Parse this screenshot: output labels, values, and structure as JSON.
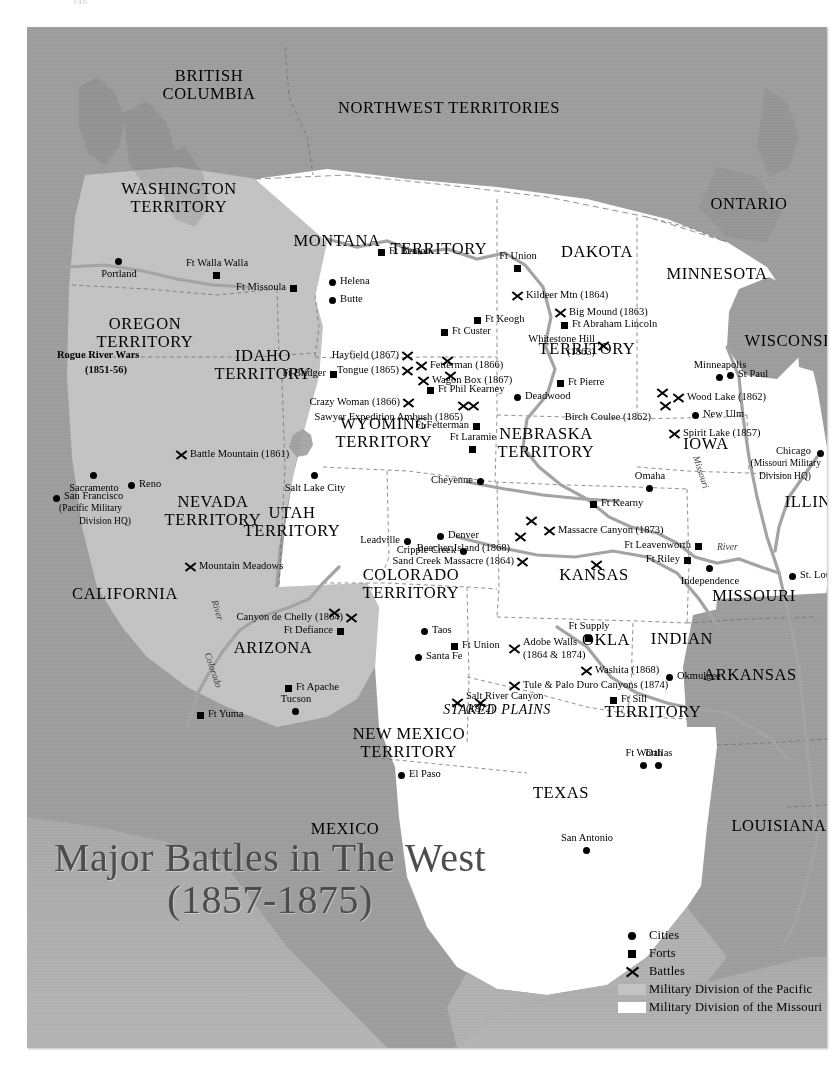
{
  "page": {
    "number": "146"
  },
  "title": {
    "line1": "Major Battles in The West",
    "line2": "(1857-1875)"
  },
  "colors": {
    "military_division_pacific": "#c2c2c2",
    "military_division_missouri": "#ffffff",
    "outside_us": "#9d9d9d",
    "water": "#b0b0b0",
    "ink": "#000000",
    "title_ink": "#4b4b4b"
  },
  "legend": {
    "items": [
      {
        "symbol": "dot",
        "label": "Cities"
      },
      {
        "symbol": "square",
        "label": "Forts"
      },
      {
        "symbol": "x",
        "label": "Battles"
      },
      {
        "symbol": "swatch-gray",
        "label": "Military Division of the Pacific"
      },
      {
        "symbol": "swatch-white",
        "label": "Military Division of the Missouri"
      }
    ]
  },
  "regions": [
    {
      "name": "BRITISH COLUMBIA",
      "lines": [
        "BRITISH",
        "COLUMBIA"
      ],
      "x": 182,
      "y": 40
    },
    {
      "name": "NORTHWEST TERRITORIES",
      "lines": [
        "NORTHWEST TERRITORIES"
      ],
      "x": 422,
      "y": 72
    },
    {
      "name": "ONTARIO",
      "lines": [
        "ONTARIO"
      ],
      "x": 722,
      "y": 168
    },
    {
      "name": "WASHINGTON TERRITORY",
      "lines": [
        "WASHINGTON",
        "TERRITORY"
      ],
      "x": 152,
      "y": 153
    },
    {
      "name": "OREGON TERRITORY",
      "lines": [
        "OREGON",
        "TERRITORY"
      ],
      "x": 118,
      "y": 288
    },
    {
      "name": "IDAHO TERRITORY",
      "lines": [
        "IDAHO",
        "TERRITORY"
      ],
      "x": 236,
      "y": 320
    },
    {
      "name": "MONTANA TERRITORY",
      "lines": [
        "MONTANA"
      ],
      "x": 310,
      "y": 205
    },
    {
      "name": "MONTANA TERRITORY 2",
      "lines": [
        "TERRITORY"
      ],
      "x": 412,
      "y": 213
    },
    {
      "name": "DAKOTA",
      "lines": [
        "DAKOTA"
      ],
      "x": 570,
      "y": 216
    },
    {
      "name": "DAKOTA TERRITORY",
      "lines": [
        "TERRITORY"
      ],
      "x": 560,
      "y": 313
    },
    {
      "name": "MINNESOTA",
      "lines": [
        "MINNESOTA"
      ],
      "x": 690,
      "y": 238
    },
    {
      "name": "WISCONSIN",
      "lines": [
        "WISCONSIN"
      ],
      "x": 766,
      "y": 305
    },
    {
      "name": "WYOMING TERRITORY",
      "lines": [
        "WYOMING",
        "TERRITORY"
      ],
      "x": 357,
      "y": 388
    },
    {
      "name": "NEBRASKA TERRITORY",
      "lines": [
        "NEBRASKA",
        "TERRITORY"
      ],
      "x": 519,
      "y": 398
    },
    {
      "name": "IOWA",
      "lines": [
        "IOWA"
      ],
      "x": 679,
      "y": 408
    },
    {
      "name": "ILLINOIS",
      "lines": [
        "ILLINOIS"
      ],
      "x": 795,
      "y": 466
    },
    {
      "name": "NEVADA TERRITORY",
      "lines": [
        "NEVADA",
        "TERRITORY"
      ],
      "x": 186,
      "y": 466
    },
    {
      "name": "UTAH TERRITORY",
      "lines": [
        "UTAH",
        "TERRITORY"
      ],
      "x": 265,
      "y": 477
    },
    {
      "name": "CALIFORNIA",
      "lines": [
        "CALIFORNIA"
      ],
      "x": 98,
      "y": 558
    },
    {
      "name": "COLORADO TERRITORY",
      "lines": [
        "COLORADO",
        "TERRITORY"
      ],
      "x": 384,
      "y": 539
    },
    {
      "name": "KANSAS",
      "lines": [
        "KANSAS"
      ],
      "x": 567,
      "y": 539
    },
    {
      "name": "MISSOURI",
      "lines": [
        "MISSOURI"
      ],
      "x": 727,
      "y": 560
    },
    {
      "name": "ARIZONA",
      "lines": [
        "ARIZONA"
      ],
      "x": 246,
      "y": 612
    },
    {
      "name": "NEW MEXICO TERRITORY",
      "lines": [
        "NEW MEXICO",
        "TERRITORY"
      ],
      "x": 382,
      "y": 698
    },
    {
      "name": "OKLA",
      "lines": [
        "OKLA"
      ],
      "x": 579,
      "y": 604
    },
    {
      "name": "INDIAN",
      "lines": [
        "INDIAN"
      ],
      "x": 655,
      "y": 603
    },
    {
      "name": "INDIAN TERRITORY",
      "lines": [
        "TERRITORY"
      ],
      "x": 626,
      "y": 676
    },
    {
      "name": "ARKANSAS",
      "lines": [
        "ARKANSAS"
      ],
      "x": 723,
      "y": 639
    },
    {
      "name": "TEXAS",
      "lines": [
        "TEXAS"
      ],
      "x": 534,
      "y": 757
    },
    {
      "name": "LOUISIANA",
      "lines": [
        "LOUISIANA"
      ],
      "x": 752,
      "y": 790
    },
    {
      "name": "MEXICO",
      "lines": [
        "MEXICO"
      ],
      "x": 318,
      "y": 793
    },
    {
      "name": "STAKED PLAINS",
      "lines": [
        "STAKED PLAINS"
      ],
      "x": 470,
      "y": 675,
      "italic": true,
      "size": "sm"
    }
  ],
  "cities": [
    {
      "label": "Portland",
      "x": 88,
      "y": 231,
      "anchor": "below"
    },
    {
      "label": "Helena",
      "x": 302,
      "y": 252,
      "anchor": "right"
    },
    {
      "label": "Butte",
      "x": 302,
      "y": 270,
      "anchor": "right"
    },
    {
      "label": "Sacramento",
      "x": 63,
      "y": 445,
      "anchor": "below"
    },
    {
      "label": "Reno",
      "x": 101,
      "y": 455,
      "anchor": "right"
    },
    {
      "label": "San Francisco",
      "x": 26,
      "y": 468,
      "anchor": "right-hq"
    },
    {
      "label": "Salt Lake City",
      "x": 284,
      "y": 445,
      "anchor": "below"
    },
    {
      "label": "Cheyenne",
      "x": 450,
      "y": 451,
      "anchor": "left"
    },
    {
      "label": "Deadwood",
      "x": 487,
      "y": 367,
      "anchor": "right"
    },
    {
      "label": "Minneapolis",
      "x": 689,
      "y": 347,
      "anchor": "above"
    },
    {
      "label": "St Paul",
      "x": 700,
      "y": 345,
      "anchor": "right"
    },
    {
      "label": "New Ulm",
      "x": 665,
      "y": 385,
      "anchor": "right"
    },
    {
      "label": "Omaha",
      "x": 619,
      "y": 458,
      "anchor": "above"
    },
    {
      "label": "Chicago",
      "x": 790,
      "y": 423,
      "anchor": "left-hq"
    },
    {
      "label": "Independence",
      "x": 679,
      "y": 538,
      "anchor": "below"
    },
    {
      "label": "St. Louis",
      "x": 762,
      "y": 546,
      "anchor": "right"
    },
    {
      "label": "Leadville",
      "x": 377,
      "y": 511,
      "anchor": "left"
    },
    {
      "label": "Denver",
      "x": 410,
      "y": 506,
      "anchor": "right"
    },
    {
      "label": "Cripple Creek",
      "x": 433,
      "y": 521,
      "anchor": "left"
    },
    {
      "label": "Okmulgee",
      "x": 639,
      "y": 647,
      "anchor": "right"
    },
    {
      "label": "Taos",
      "x": 394,
      "y": 601,
      "anchor": "right"
    },
    {
      "label": "Santa Fe",
      "x": 388,
      "y": 627,
      "anchor": "right"
    },
    {
      "label": "Tucson",
      "x": 265,
      "y": 681,
      "anchor": "above"
    },
    {
      "label": "El Paso",
      "x": 371,
      "y": 745,
      "anchor": "right"
    },
    {
      "label": "Ft Worth",
      "x": 613,
      "y": 735,
      "anchor": "above"
    },
    {
      "label": "Dallas",
      "x": 628,
      "y": 735,
      "anchor": "above"
    },
    {
      "label": "San Antonio",
      "x": 556,
      "y": 820,
      "anchor": "above"
    }
  ],
  "forts": [
    {
      "label": "Ft Walla Walla",
      "x": 186,
      "y": 245,
      "anchor": "above"
    },
    {
      "label": "Ft Missoula",
      "x": 263,
      "y": 258,
      "anchor": "left"
    },
    {
      "label": "Ft Benton",
      "x": 351,
      "y": 222,
      "anchor": "right"
    },
    {
      "label": "Ft Union",
      "x": 487,
      "y": 238,
      "anchor": "above"
    },
    {
      "label": "Ft Keogh",
      "x": 447,
      "y": 290,
      "anchor": "right"
    },
    {
      "label": "Ft Custer",
      "x": 414,
      "y": 302,
      "anchor": "right"
    },
    {
      "label": "Ft Abraham Lincoln",
      "x": 534,
      "y": 295,
      "anchor": "right"
    },
    {
      "label": "Ft Pierre",
      "x": 530,
      "y": 353,
      "anchor": "right"
    },
    {
      "label": "Ft Bridger",
      "x": 303,
      "y": 344,
      "anchor": "left"
    },
    {
      "label": "Ft Phil Kearney",
      "x": 400,
      "y": 360,
      "anchor": "right"
    },
    {
      "label": "Ft Fetterman",
      "x": 446,
      "y": 396,
      "anchor": "left"
    },
    {
      "label": "Ft Laramie",
      "x": 442,
      "y": 419,
      "anchor": "above"
    },
    {
      "label": "Ft Kearny",
      "x": 563,
      "y": 474,
      "anchor": "right"
    },
    {
      "label": "Ft Leavenworth",
      "x": 668,
      "y": 516,
      "anchor": "left"
    },
    {
      "label": "Ft Riley",
      "x": 657,
      "y": 530,
      "anchor": "left"
    },
    {
      "label": "Ft Defiance",
      "x": 310,
      "y": 601,
      "anchor": "left"
    },
    {
      "label": "Ft Apache",
      "x": 258,
      "y": 658,
      "anchor": "right"
    },
    {
      "label": "Ft Yuma",
      "x": 170,
      "y": 685,
      "anchor": "right"
    },
    {
      "label": "Ft Union",
      "x": 424,
      "y": 616,
      "anchor": "right"
    },
    {
      "label": "Ft Supply",
      "x": 558,
      "y": 608,
      "anchor": "above"
    },
    {
      "label": "Ft Sill",
      "x": 583,
      "y": 670,
      "anchor": "right"
    }
  ],
  "battles": [
    {
      "label": "Rogue River Wars",
      "label2": "(1851-56)",
      "x": 30,
      "y": 322,
      "style": "bold-no-marker"
    },
    {
      "label": "Battle Mountain (1861)",
      "x": 148,
      "y": 421,
      "anchor": "right"
    },
    {
      "label": "Mountain Meadows",
      "label2": "Massacre (1857)",
      "x": 157,
      "y": 533,
      "anchor": "right"
    },
    {
      "label": "Canyon de Chelly (1864)",
      "x": 318,
      "y": 584,
      "anchor": "left"
    },
    {
      "label": "Salt River Canyon",
      "label2": "(1872)",
      "x": 424,
      "y": 669,
      "anchor": "right-two"
    },
    {
      "label": "Hayfield (1867)",
      "x": 374,
      "y": 322,
      "anchor": "left"
    },
    {
      "label": "Tongue (1865)",
      "x": 374,
      "y": 337,
      "anchor": "left"
    },
    {
      "label": "Fetterman (1866)",
      "x": 388,
      "y": 332,
      "anchor": "right"
    },
    {
      "label": "Wagon Box (1867)",
      "x": 390,
      "y": 347,
      "anchor": "right"
    },
    {
      "label": "Crazy Woman (1866)",
      "x": 375,
      "y": 369,
      "anchor": "left"
    },
    {
      "label": "Sawyer Expedition Ambush (1865)",
      "x": 440,
      "y": 372,
      "anchor": "below-x"
    },
    {
      "label": "Kildeer Mtn (1864)",
      "x": 484,
      "y": 262,
      "anchor": "right"
    },
    {
      "label": "Big Mound (1863)",
      "x": 527,
      "y": 279,
      "anchor": "right"
    },
    {
      "label": "Whitestone Hill",
      "label2": "(1863)",
      "x": 570,
      "y": 312,
      "anchor": "left-two"
    },
    {
      "label": "Wood Lake (1862)",
      "x": 645,
      "y": 364,
      "anchor": "right"
    },
    {
      "label": "Birch Coulee (1862)",
      "x": 632,
      "y": 372,
      "anchor": "below-left"
    },
    {
      "label": "Spirit Lake (1857)",
      "x": 641,
      "y": 400,
      "anchor": "right"
    },
    {
      "label": "Massacre Canyon (1873)",
      "x": 516,
      "y": 497,
      "anchor": "right"
    },
    {
      "label": "Beecher Island (1868)",
      "x": 487,
      "y": 503,
      "anchor": "below-x"
    },
    {
      "label": "Sand Creek Massacre (1864)",
      "x": 489,
      "y": 528,
      "anchor": "left"
    },
    {
      "label": "Adobe Walls",
      "label2": "(1864 & 1874)",
      "x": 481,
      "y": 615,
      "anchor": "right-two"
    },
    {
      "label": "Washita (1868)",
      "x": 553,
      "y": 637,
      "anchor": "right"
    },
    {
      "label": "Tule & Palo Duro Canyons (1874)",
      "x": 481,
      "y": 652,
      "anchor": "right"
    }
  ],
  "rivers": [
    {
      "label": "Missouri",
      "x": 657,
      "y": 440
    },
    {
      "label": "River",
      "x": 690,
      "y": 515
    },
    {
      "label": "River",
      "x": 180,
      "y": 578
    },
    {
      "label": "Colorado",
      "x": 168,
      "y": 638
    }
  ]
}
